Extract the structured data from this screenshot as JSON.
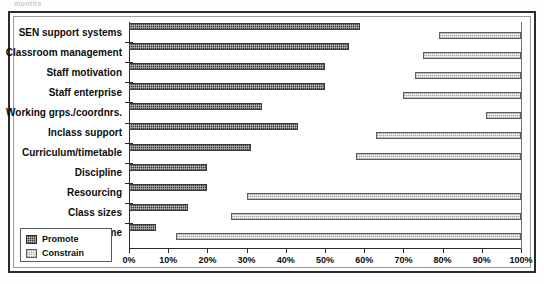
{
  "fragment_text": "months",
  "legend": {
    "position": "bottom-left-inside",
    "items": [
      {
        "label": "Promote",
        "key": "promote",
        "color": "#3a3a3a"
      },
      {
        "label": "Constrain",
        "key": "constrain",
        "color": "#d2d2d2"
      }
    ]
  },
  "axis": {
    "ticks": [
      "0%",
      "10%",
      "20%",
      "30%",
      "40%",
      "50%",
      "60%",
      "70%",
      "80%",
      "90%",
      "100%"
    ],
    "min": 0,
    "max": 100
  },
  "chart_data": {
    "type": "bar",
    "orientation": "horizontal",
    "title": "",
    "subtitle": "",
    "xlabel": "",
    "ylabel": "",
    "xlim": [
      0,
      100
    ],
    "grid": false,
    "legend_position": "bottom-left-inside",
    "tick_labels": [
      "0%",
      "10%",
      "20%",
      "30%",
      "40%",
      "50%",
      "60%",
      "70%",
      "80%",
      "90%",
      "100%"
    ],
    "categories": [
      "SEN support systems",
      "Classroom management",
      "Staff motivation",
      "Staff enterprise",
      "Working grps./coordnrs.",
      "Inclass support",
      "Curriculum/timetable",
      "Discipline",
      "Resourcing",
      "Class sizes",
      "Time"
    ],
    "series": [
      {
        "name": "Promote",
        "color": "#3a3a3a",
        "anchor": "left",
        "values": [
          59,
          56,
          50,
          50,
          34,
          43,
          31,
          20,
          20,
          15,
          7
        ]
      },
      {
        "name": "Constrain",
        "color": "#d2d2d2",
        "anchor": "right",
        "note": "bars run from start value to 100%",
        "starts": [
          79,
          75,
          73,
          70,
          91,
          63,
          58,
          100,
          30,
          26,
          12
        ],
        "values": [
          21,
          25,
          27,
          30,
          9,
          37,
          42,
          0,
          70,
          74,
          88
        ]
      }
    ]
  }
}
